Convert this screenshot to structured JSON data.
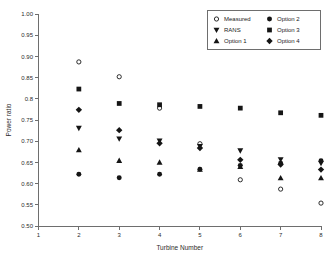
{
  "chart_data": {
    "type": "scatter",
    "title": "",
    "xlabel": "Turbine Number",
    "ylabel": "Power ratio",
    "xlim": [
      1,
      8
    ],
    "ylim": [
      0.5,
      1.0
    ],
    "grid": false,
    "legend_position": "top-right",
    "x_ticks": [
      "1",
      "2",
      "3",
      "4",
      "5",
      "6",
      "7",
      "8"
    ],
    "x_tick_values": [
      1,
      2,
      3,
      4,
      5,
      6,
      7,
      8
    ],
    "y_ticks": [
      "0.50",
      "0.55",
      "0.60",
      "0.65",
      "0.70",
      "0.75",
      "0.8",
      "0.85",
      "0.90",
      "0.95",
      "1.00"
    ],
    "y_tick_values": [
      0.5,
      0.55,
      0.6,
      0.65,
      0.7,
      0.75,
      0.8,
      0.85,
      0.9,
      0.95,
      1.0
    ],
    "x": [
      2,
      3,
      4,
      5,
      6,
      7,
      8
    ],
    "series": [
      {
        "name": "Measured",
        "marker": "open-circle",
        "color": "#151515",
        "values": [
          0.887,
          0.852,
          0.778,
          0.694,
          0.609,
          0.587,
          0.554
        ]
      },
      {
        "name": "RANS",
        "marker": "triangle-down",
        "color": "#151515",
        "values": [
          0.731,
          0.706,
          0.701,
          0.688,
          0.678,
          0.657,
          0.648
        ]
      },
      {
        "name": "Option 1",
        "marker": "triangle-up",
        "color": "#151515",
        "values": [
          0.679,
          0.654,
          0.65,
          0.633,
          0.64,
          0.613,
          0.613
        ]
      },
      {
        "name": "Option 2",
        "marker": "circle",
        "color": "#151515",
        "values": [
          0.622,
          0.614,
          0.622,
          0.634,
          0.643,
          0.648,
          0.654
        ]
      },
      {
        "name": "Option 3",
        "marker": "square",
        "color": "#151515",
        "values": [
          0.823,
          0.789,
          0.786,
          0.782,
          0.778,
          0.767,
          0.761
        ]
      },
      {
        "name": "Option 4",
        "marker": "diamond",
        "color": "#151515",
        "values": [
          0.774,
          0.726,
          0.695,
          0.684,
          0.656,
          0.645,
          0.633
        ]
      }
    ]
  },
  "legend": {
    "entries": [
      {
        "label": "Measured",
        "marker": "open-circle",
        "col": 0,
        "row": 0
      },
      {
        "label": "RANS",
        "marker": "triangle-down",
        "col": 0,
        "row": 1
      },
      {
        "label": "Option 1",
        "marker": "triangle-up",
        "col": 0,
        "row": 2
      },
      {
        "label": "Option 2",
        "marker": "circle",
        "col": 1,
        "row": 0
      },
      {
        "label": "Option 3",
        "marker": "square",
        "col": 1,
        "row": 1
      },
      {
        "label": "Option 4",
        "marker": "diamond",
        "col": 1,
        "row": 2
      }
    ]
  },
  "style": {
    "axis_color": "#6e6e6e",
    "marker_color": "#151515",
    "background": "#ffffff"
  }
}
